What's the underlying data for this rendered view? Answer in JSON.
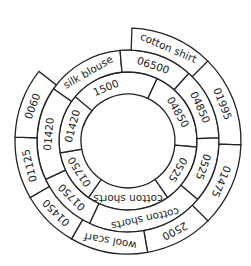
{
  "diagram": {
    "type": "spiral-ring",
    "center": [
      128,
      141
    ],
    "rings": [
      {
        "name": "inner",
        "r_inner": 47,
        "r_outer": 69,
        "segments": [
          {
            "label": "1500",
            "start": -70,
            "end": 25
          },
          {
            "label": "04850",
            "start": 25,
            "end": 95
          },
          {
            "label": "0525",
            "start": 95,
            "end": 145
          },
          {
            "label": "cotton shorts",
            "start": 145,
            "end": 215
          },
          {
            "label": "01750",
            "start": 215,
            "end": 260
          },
          {
            "label": "01420",
            "start": 260,
            "end": 310
          }
        ]
      },
      {
        "name": "middle",
        "r_inner": 69,
        "r_outer": 91,
        "segments": [
          {
            "label": "silk blouse",
            "start": -55,
            "end": -5
          },
          {
            "label": "06500",
            "start": -5,
            "end": 42
          },
          {
            "label": "04850",
            "start": 42,
            "end": 88
          },
          {
            "label": "0525",
            "start": 88,
            "end": 130
          },
          {
            "label": "cotton shorts",
            "start": 130,
            "end": 205
          },
          {
            "label": "01750",
            "start": 205,
            "end": 245
          },
          {
            "label": "01420",
            "start": 245,
            "end": 305
          }
        ]
      },
      {
        "name": "outer",
        "r_inner": 91,
        "r_outer": 113,
        "segments": [
          {
            "label": "cotton shirt",
            "start": 2,
            "end": 45
          },
          {
            "label": "01995",
            "start": 45,
            "end": 92
          },
          {
            "label": "01475",
            "start": 92,
            "end": 135
          },
          {
            "label": "2500",
            "start": 135,
            "end": 170
          },
          {
            "label": "wool scarf",
            "start": 170,
            "end": 210
          },
          {
            "label": "01450",
            "start": 210,
            "end": 240
          },
          {
            "label": "01125",
            "start": 240,
            "end": 272
          },
          {
            "label": "0060",
            "start": 272,
            "end": 308
          }
        ]
      }
    ]
  }
}
